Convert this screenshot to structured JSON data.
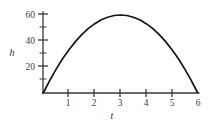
{
  "chart_data": {
    "type": "line",
    "title": "",
    "subtitle": "",
    "xlabel": "t",
    "ylabel": "h",
    "xlim": [
      0,
      6
    ],
    "ylim": [
      0,
      62
    ],
    "grid": false,
    "legend": null,
    "x_ticks": [
      {
        "value": 0,
        "label": ""
      },
      {
        "value": 1,
        "label": "1"
      },
      {
        "value": 2,
        "label": "2"
      },
      {
        "value": 3,
        "label": "3"
      },
      {
        "value": 4,
        "label": "4"
      },
      {
        "value": 5,
        "label": "5"
      },
      {
        "value": 6,
        "label": "6"
      }
    ],
    "y_ticks": [
      {
        "value": 0,
        "label": "",
        "major": false
      },
      {
        "value": 10,
        "label": "",
        "major": false
      },
      {
        "value": 20,
        "label": "20",
        "major": true
      },
      {
        "value": 30,
        "label": "",
        "major": false
      },
      {
        "value": 40,
        "label": "40",
        "major": true
      },
      {
        "value": 50,
        "label": "",
        "major": false
      },
      {
        "value": 60,
        "label": "60",
        "major": true
      }
    ],
    "series": [
      {
        "name": "h(t)",
        "style": "solid",
        "color": "#141414",
        "x": [
          0,
          0.25,
          0.5,
          0.75,
          1,
          1.25,
          1.5,
          1.75,
          2,
          2.25,
          2.5,
          2.75,
          3,
          3.25,
          3.5,
          3.75,
          4,
          4.25,
          4.5,
          4.75,
          5,
          5.25,
          5.5,
          5.75,
          6
        ],
        "y": [
          0,
          9.6,
          18.3,
          26.3,
          33.3,
          39.6,
          45,
          49.6,
          53.3,
          56.3,
          58.3,
          59.6,
          60,
          59.6,
          58.3,
          56.3,
          53.3,
          49.6,
          45,
          39.6,
          33.3,
          26.3,
          18.3,
          9.6,
          0
        ]
      }
    ],
    "annotations": []
  },
  "axis_titles": {
    "y": "h",
    "x": "t"
  },
  "colors": {
    "axis": "#3a3a3a",
    "curve": "#141414",
    "label": "#404040",
    "background": "#ffffff"
  }
}
